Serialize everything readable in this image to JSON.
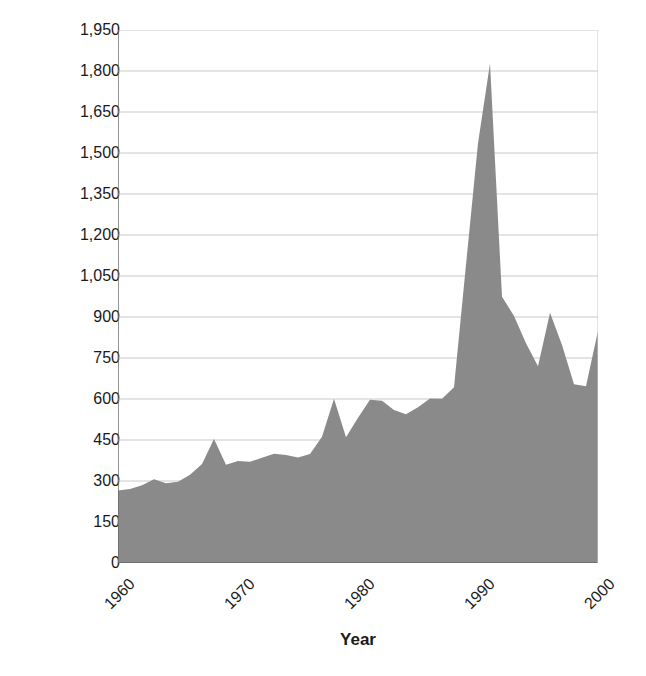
{
  "chart_data": {
    "type": "area",
    "title": "",
    "xlabel": "Year",
    "ylabel": "Number of immigrants, in thousands",
    "xlim": [
      1960,
      2000
    ],
    "ylim": [
      0,
      1950
    ],
    "grid": true,
    "legend": false,
    "fill_color": "#8a8a8a",
    "grid_color": "#c9c9c9",
    "axis_color": "#666666",
    "y_ticks": [
      0,
      150,
      300,
      450,
      600,
      750,
      900,
      1050,
      1200,
      1350,
      1500,
      1650,
      1800,
      1950
    ],
    "y_tick_labels": [
      "0",
      "150",
      "300",
      "450",
      "600",
      "750",
      "900",
      "1,050",
      "1,200",
      "1,350",
      "1,500",
      "1,650",
      "1,800",
      "1,950"
    ],
    "x_ticks": [
      1960,
      1970,
      1980,
      1990,
      2000
    ],
    "x_tick_labels": [
      "1960",
      "1970",
      "1980",
      "1990",
      "2000"
    ],
    "x": [
      1960,
      1961,
      1962,
      1963,
      1964,
      1965,
      1966,
      1967,
      1968,
      1969,
      1970,
      1971,
      1972,
      1973,
      1974,
      1975,
      1976,
      1977,
      1978,
      1979,
      1980,
      1981,
      1982,
      1983,
      1984,
      1985,
      1986,
      1987,
      1988,
      1989,
      1990,
      1991,
      1992,
      1993,
      1994,
      1995,
      1996,
      1997,
      1998,
      1999,
      2000
    ],
    "values": [
      265,
      271,
      284,
      306,
      292,
      297,
      323,
      362,
      454,
      359,
      373,
      370,
      385,
      400,
      395,
      386,
      399,
      462,
      601,
      460,
      531,
      597,
      594,
      560,
      544,
      570,
      602,
      601,
      643,
      1091,
      1536,
      1827,
      974,
      904,
      804,
      720,
      916,
      798,
      654,
      647,
      850
    ]
  },
  "figure": {
    "x_axis_title": "Year",
    "y_axis_title": "Number of immigrants, in thousands"
  }
}
